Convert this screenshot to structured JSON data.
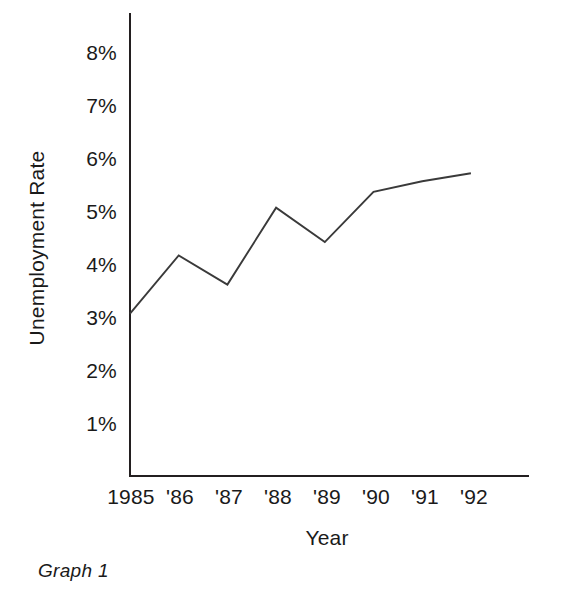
{
  "chart_data": {
    "type": "line",
    "title": "",
    "subtitle": "",
    "xlabel": "Year",
    "ylabel": "Unemployment Rate",
    "categories": [
      "1985",
      "'86",
      "'87",
      "'88",
      "'89",
      "'90",
      "'91",
      "'92"
    ],
    "x_tick_labels": [
      "1985",
      "'86",
      "'87",
      "'88",
      "'89",
      "'90",
      "'91",
      "'92"
    ],
    "y_tick_labels": [
      "1%",
      "2%",
      "3%",
      "4%",
      "5%",
      "6%",
      "7%",
      "8%"
    ],
    "y_tick_values": [
      1,
      2,
      3,
      4,
      5,
      6,
      7,
      8
    ],
    "ylim": [
      0,
      8.5
    ],
    "xlim": [
      1985,
      1992
    ],
    "grid": false,
    "legend": false,
    "legend_position": "none",
    "series": [
      {
        "name": "Unemployment Rate",
        "color": "#3a3a3a",
        "values": [
          3.1,
          4.2,
          3.65,
          5.1,
          4.45,
          5.4,
          5.6,
          5.75
        ]
      }
    ],
    "annotations": []
  },
  "caption": {
    "label": "Graph 1"
  },
  "axes": {
    "y_axis_title": "Unemployment Rate",
    "x_axis_title": "Year"
  }
}
